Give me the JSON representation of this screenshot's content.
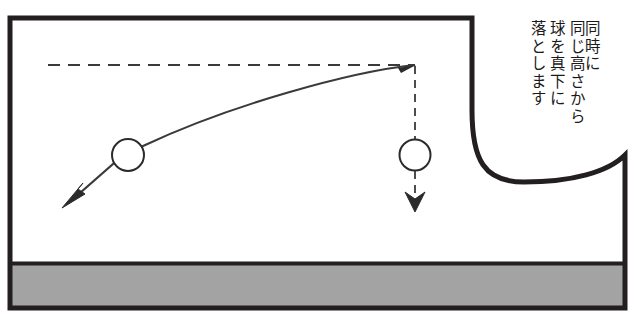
{
  "figure": {
    "caption_lines": [
      "同時に",
      "同じ高さから",
      "球を真下に",
      "落とします"
    ],
    "caption_full": "同時に同じ高さから球を真下に落とします",
    "colors": {
      "ink": "#231f20",
      "ground_fill": "#a3a3a3",
      "background": "#ffffff",
      "thin_line": "#3a3a3a"
    },
    "elements": {
      "left_ball_label": "ball-left",
      "right_ball_label": "ball-right",
      "trajectory_label": "curved-trajectory",
      "dashed_height_line_label": "dashed-reference-height",
      "dashed_drop_line_label": "dashed-vertical-drop",
      "left_arrow_label": "velocity-arrow-left",
      "down_arrow_label": "fall-arrow-down",
      "ground_label": "ground-band"
    },
    "geometry": {
      "frame_left": 10,
      "frame_top": 18,
      "frame_top_right": 472,
      "frame_right": 625,
      "frame_bottom": 308,
      "ground_top": 263,
      "dashed_height_y": 65,
      "left_ball": {
        "cx": 128,
        "cy": 155,
        "r": 16
      },
      "right_ball": {
        "cx": 415,
        "cy": 155,
        "r": 15
      },
      "launch_point": {
        "x": 415,
        "y": 65
      }
    }
  }
}
